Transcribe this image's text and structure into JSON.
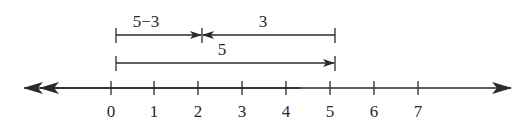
{
  "diagram": {
    "type": "number-line",
    "colors": {
      "stroke": "#2a2a2a",
      "background": "#ffffff"
    },
    "number_line": {
      "ticks": [
        "0",
        "1",
        "2",
        "3",
        "4",
        "5",
        "6",
        "7"
      ],
      "arrows": [
        "left",
        "right"
      ]
    },
    "segments": [
      {
        "id": "difference",
        "label": "5−3",
        "from": 0,
        "to": 2,
        "direction": "right"
      },
      {
        "id": "subtrahend",
        "label": "3",
        "from": 5,
        "to": 2,
        "direction": "left"
      },
      {
        "id": "minuend",
        "label": "5",
        "from": 0,
        "to": 5,
        "direction": "right"
      }
    ]
  }
}
